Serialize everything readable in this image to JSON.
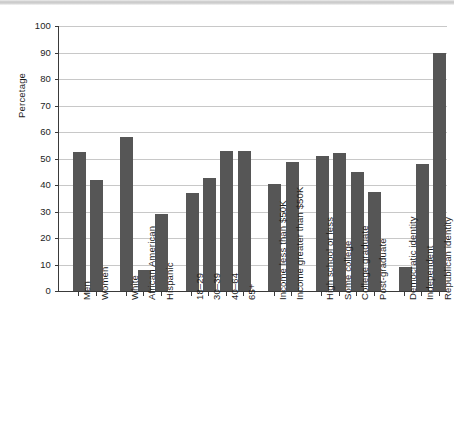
{
  "chart_data": {
    "type": "bar",
    "title": "",
    "xlabel": "",
    "ylabel": "Percetage",
    "ylim": [
      0,
      100
    ],
    "ytick_step": 10,
    "yticks": [
      0,
      10,
      20,
      30,
      40,
      50,
      60,
      70,
      80,
      90,
      100
    ],
    "grid": true,
    "legend": "none",
    "bar_color": "#565656",
    "axis_color": "#3a3a3a",
    "gridline_color": "#c8c8c8",
    "categories": [
      "Men",
      "Women",
      "White",
      "African American",
      "Hispanic",
      "18–29",
      "30–39",
      "40–64",
      "65+",
      "Income less than $50K",
      "Income greater than $50K",
      "High school or less",
      "Some college",
      "College graduate",
      "Post-graduate",
      "Democratic identity",
      "Independent",
      "Republican identity"
    ],
    "values": [
      52.5,
      42,
      58,
      8,
      29,
      37,
      42.5,
      53,
      53,
      40.5,
      48.5,
      51,
      52,
      45,
      37.5,
      9,
      48,
      90
    ],
    "groups": [
      {
        "name": "Gender",
        "categories": [
          "Men",
          "Women"
        ]
      },
      {
        "name": "Race/Ethnicity",
        "categories": [
          "White",
          "African American",
          "Hispanic"
        ]
      },
      {
        "name": "Age",
        "categories": [
          "18–29",
          "30–39",
          "40–64",
          "65+"
        ]
      },
      {
        "name": "Income",
        "categories": [
          "Income less than $50K",
          "Income greater than $50K"
        ]
      },
      {
        "name": "Education",
        "categories": [
          "High school or less",
          "Some college",
          "College graduate",
          "Post-graduate"
        ]
      },
      {
        "name": "Party identity",
        "categories": [
          "Democratic identity",
          "Independent",
          "Republican identity"
        ]
      }
    ]
  },
  "layout": {
    "bar_positions": [
      18,
      41,
      81,
      104,
      127,
      167,
      190,
      213,
      236,
      276,
      299,
      339,
      362,
      385,
      408,
      448,
      471,
      494
    ]
  }
}
